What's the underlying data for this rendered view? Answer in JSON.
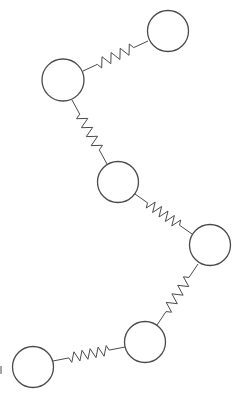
{
  "diagram": {
    "title": "",
    "stroke_color": "#4a4a4a",
    "background_color": "#ffffff",
    "masses": [
      {
        "id": "m1",
        "cx": 168,
        "cy": 31,
        "r": 20.5
      },
      {
        "id": "m2",
        "cx": 63,
        "cy": 80,
        "r": 21
      },
      {
        "id": "m3",
        "cx": 118,
        "cy": 182,
        "r": 20.5
      },
      {
        "id": "m4",
        "cx": 210,
        "cy": 245,
        "r": 20.5
      },
      {
        "id": "m5",
        "cx": 145,
        "cy": 342,
        "r": 20.5
      },
      {
        "id": "m6",
        "cx": 33,
        "cy": 367,
        "r": 20.5
      }
    ],
    "springs": [
      {
        "id": "s1",
        "from": "m2",
        "to": "m1",
        "x1": 83,
        "y1": 71,
        "x2": 148,
        "y2": 41,
        "coils": 4
      },
      {
        "id": "s2",
        "from": "m2",
        "to": "m3",
        "x1": 72,
        "y1": 100,
        "x2": 107,
        "y2": 164,
        "coils": 4
      },
      {
        "id": "s3",
        "from": "m3",
        "to": "m4",
        "x1": 135,
        "y1": 194,
        "x2": 192,
        "y2": 234,
        "coils": 5
      },
      {
        "id": "s4",
        "from": "m4",
        "to": "m5",
        "x1": 198,
        "y1": 264,
        "x2": 157,
        "y2": 325,
        "coils": 4
      },
      {
        "id": "s5",
        "from": "m6",
        "to": "m5",
        "x1": 53,
        "y1": 361,
        "x2": 125,
        "y2": 347,
        "coils": 5
      }
    ],
    "edge_mark": {
      "x": 1,
      "y1": 366,
      "y2": 374
    }
  }
}
